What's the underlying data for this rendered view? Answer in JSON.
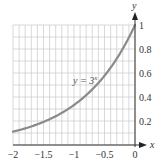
{
  "chart_data": {
    "type": "line",
    "title": "",
    "xlabel": "x",
    "ylabel": "y",
    "xlim": [
      -2,
      0
    ],
    "ylim": [
      0,
      1
    ],
    "grid": true,
    "grid_step": {
      "x": 0.1,
      "y": 0.1
    },
    "x_ticks": [
      -2,
      -1.5,
      -1,
      -0.5,
      0
    ],
    "x_tick_labels": [
      "−2",
      "−1.5",
      "−1",
      "−0.5",
      "0"
    ],
    "y_ticks": [
      0.2,
      0.4,
      0.6,
      0.8,
      1
    ],
    "y_tick_labels": [
      "0.2",
      "0.4",
      "0.6",
      "0.8",
      "1"
    ],
    "series": [
      {
        "name": "y = 3^x",
        "label_text": "y = 3",
        "label_superscript": "x",
        "function": "3^x",
        "x": [
          -2,
          -1.75,
          -1.5,
          -1.25,
          -1,
          -0.75,
          -0.5,
          -0.25,
          0
        ],
        "values": [
          0.111,
          0.146,
          0.192,
          0.253,
          0.333,
          0.439,
          0.577,
          0.76,
          1.0
        ],
        "color": "#8a8a8a"
      }
    ],
    "legend": "inline annotation near curve"
  },
  "colors": {
    "grid": "#c8c8c8",
    "axis": "#333333",
    "curve": "#8a8a8a",
    "text": "#333333"
  }
}
